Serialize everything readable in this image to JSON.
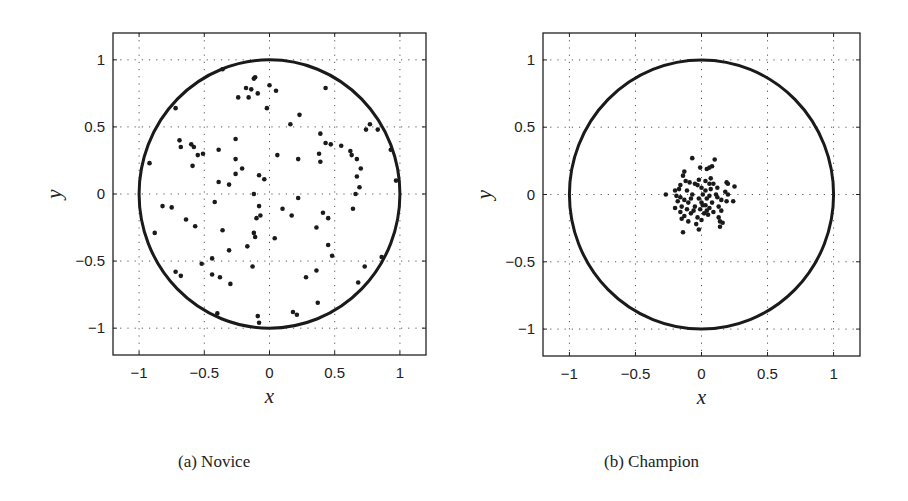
{
  "figure": {
    "captions": [
      "(a) Novice",
      "(b) Champion"
    ]
  },
  "chart_data": [
    {
      "type": "scatter",
      "title": "(a) Novice",
      "xlabel": "x",
      "ylabel": "y",
      "xlim": [
        -1.2,
        1.2
      ],
      "ylim": [
        -1.2,
        1.2
      ],
      "xticks": [
        -1,
        -0.5,
        0,
        0.5,
        1
      ],
      "yticks": [
        -1,
        -0.5,
        0,
        0.5,
        1
      ],
      "xtick_labels": [
        "−1",
        "−0.5",
        "0",
        "0.5",
        "1"
      ],
      "ytick_labels": [
        "−1",
        "−0.5",
        "0",
        "0.5",
        "1"
      ],
      "grid": true,
      "grid_style": "dotted",
      "overlay": {
        "shape": "circle",
        "center": [
          0,
          0
        ],
        "radius": 1
      },
      "points": [
        [
          -0.11,
          0.87
        ],
        [
          -0.12,
          0.86
        ],
        [
          -0.18,
          0.79
        ],
        [
          -0.14,
          0.78
        ],
        [
          -0.16,
          0.72
        ],
        [
          -0.24,
          0.72
        ],
        [
          -0.09,
          0.75
        ],
        [
          0.0,
          0.81
        ],
        [
          0.05,
          0.77
        ],
        [
          -0.02,
          0.64
        ],
        [
          -0.36,
          0.93
        ],
        [
          -0.72,
          0.64
        ],
        [
          0.43,
          0.79
        ],
        [
          0.16,
          0.52
        ],
        [
          0.23,
          0.59
        ],
        [
          0.77,
          0.52
        ],
        [
          0.74,
          0.48
        ],
        [
          0.83,
          0.48
        ],
        [
          0.93,
          0.33
        ],
        [
          -0.69,
          0.4
        ],
        [
          -0.68,
          0.35
        ],
        [
          -0.6,
          0.37
        ],
        [
          -0.58,
          0.35
        ],
        [
          -0.55,
          0.29
        ],
        [
          -0.51,
          0.3
        ],
        [
          -0.59,
          0.21
        ],
        [
          -0.92,
          0.23
        ],
        [
          -0.39,
          0.33
        ],
        [
          -0.26,
          0.41
        ],
        [
          -0.26,
          0.26
        ],
        [
          -0.26,
          0.15
        ],
        [
          -0.21,
          0.19
        ],
        [
          -0.39,
          0.09
        ],
        [
          -0.31,
          0.07
        ],
        [
          -0.08,
          0.14
        ],
        [
          -0.04,
          0.11
        ],
        [
          0.06,
          0.29
        ],
        [
          0.22,
          0.26
        ],
        [
          0.39,
          0.45
        ],
        [
          0.43,
          0.38
        ],
        [
          0.47,
          0.37
        ],
        [
          0.38,
          0.3
        ],
        [
          0.39,
          0.24
        ],
        [
          0.55,
          0.36
        ],
        [
          0.62,
          0.32
        ],
        [
          0.63,
          0.29
        ],
        [
          0.67,
          0.26
        ],
        [
          0.7,
          0.19
        ],
        [
          0.67,
          0.13
        ],
        [
          0.69,
          0.05
        ],
        [
          0.66,
          0.0
        ],
        [
          0.97,
          0.1
        ],
        [
          -0.12,
          0.0
        ],
        [
          0.22,
          -0.03
        ],
        [
          -0.08,
          -0.09
        ],
        [
          0.1,
          -0.11
        ],
        [
          0.17,
          -0.16
        ],
        [
          -0.07,
          -0.16
        ],
        [
          -0.1,
          -0.18
        ],
        [
          -0.82,
          -0.09
        ],
        [
          -0.75,
          -0.1
        ],
        [
          -0.64,
          -0.19
        ],
        [
          -0.57,
          -0.24
        ],
        [
          -0.42,
          -0.06
        ],
        [
          -0.36,
          -0.27
        ],
        [
          -0.12,
          -0.29
        ],
        [
          -0.11,
          -0.32
        ],
        [
          0.04,
          -0.33
        ],
        [
          0.41,
          -0.14
        ],
        [
          0.45,
          -0.18
        ],
        [
          0.64,
          -0.11
        ],
        [
          0.36,
          -0.25
        ],
        [
          -0.88,
          -0.29
        ],
        [
          -0.31,
          -0.42
        ],
        [
          -0.17,
          -0.39
        ],
        [
          0.45,
          -0.38
        ],
        [
          0.48,
          -0.46
        ],
        [
          -0.44,
          -0.48
        ],
        [
          -0.52,
          -0.52
        ],
        [
          -0.13,
          -0.54
        ],
        [
          0.73,
          -0.54
        ],
        [
          0.86,
          -0.47
        ],
        [
          -0.72,
          -0.58
        ],
        [
          -0.68,
          -0.61
        ],
        [
          -0.44,
          -0.6
        ],
        [
          -0.38,
          -0.62
        ],
        [
          -0.3,
          -0.67
        ],
        [
          0.28,
          -0.62
        ],
        [
          0.36,
          -0.57
        ],
        [
          0.68,
          -0.66
        ],
        [
          0.37,
          -0.81
        ],
        [
          0.18,
          -0.88
        ],
        [
          0.21,
          -0.9
        ],
        [
          -0.09,
          -0.91
        ],
        [
          -0.08,
          -0.96
        ],
        [
          -0.4,
          -0.89
        ]
      ]
    },
    {
      "type": "scatter",
      "title": "(b) Champion",
      "xlabel": "x",
      "ylabel": "y",
      "xlim": [
        -1.2,
        1.2
      ],
      "ylim": [
        -1.2,
        1.2
      ],
      "xticks": [
        -1,
        -0.5,
        0,
        0.5,
        1
      ],
      "yticks": [
        -1,
        -0.5,
        0,
        0.5,
        1
      ],
      "xtick_labels": [
        "−1",
        "−0.5",
        "0",
        "0.5",
        "1"
      ],
      "ytick_labels": [
        "−1",
        "−0.5",
        "0",
        "0.5",
        "1"
      ],
      "grid": true,
      "grid_style": "dotted",
      "overlay": {
        "shape": "circle",
        "center": [
          0,
          0
        ],
        "radius": 1
      },
      "points": [
        [
          -0.07,
          0.27
        ],
        [
          0.1,
          0.26
        ],
        [
          -0.01,
          0.2
        ],
        [
          0.06,
          0.2
        ],
        [
          0.08,
          0.21
        ],
        [
          0.04,
          0.19
        ],
        [
          -0.13,
          0.17
        ],
        [
          -0.14,
          0.14
        ],
        [
          -0.02,
          0.11
        ],
        [
          0.03,
          0.1
        ],
        [
          -0.09,
          0.09
        ],
        [
          0.06,
          0.08
        ],
        [
          0.09,
          0.08
        ],
        [
          0.19,
          0.09
        ],
        [
          0.2,
          0.08
        ],
        [
          -0.05,
          0.08
        ],
        [
          -0.16,
          0.07
        ],
        [
          0.25,
          0.06
        ],
        [
          -0.17,
          0.04
        ],
        [
          0.0,
          0.05
        ],
        [
          0.12,
          0.05
        ],
        [
          -0.2,
          0.03
        ],
        [
          -0.11,
          0.03
        ],
        [
          0.03,
          0.03
        ],
        [
          0.07,
          0.04
        ],
        [
          0.18,
          0.02
        ],
        [
          -0.27,
          0.0
        ],
        [
          -0.19,
          -0.01
        ],
        [
          -0.07,
          0.0
        ],
        [
          0.01,
          0.0
        ],
        [
          0.11,
          0.0
        ],
        [
          0.2,
          0.0
        ],
        [
          -0.16,
          -0.02
        ],
        [
          -0.13,
          -0.04
        ],
        [
          -0.02,
          -0.03
        ],
        [
          0.04,
          -0.03
        ],
        [
          0.15,
          -0.04
        ],
        [
          0.24,
          -0.05
        ],
        [
          -0.18,
          -0.05
        ],
        [
          -0.1,
          -0.06
        ],
        [
          0.0,
          -0.06
        ],
        [
          0.08,
          -0.06
        ],
        [
          0.19,
          -0.05
        ],
        [
          -0.15,
          -0.09
        ],
        [
          -0.05,
          -0.09
        ],
        [
          0.03,
          -0.08
        ],
        [
          0.06,
          -0.1
        ],
        [
          0.13,
          -0.09
        ],
        [
          -0.2,
          -0.1
        ],
        [
          -0.11,
          -0.11
        ],
        [
          -0.01,
          -0.11
        ],
        [
          0.04,
          -0.12
        ],
        [
          0.15,
          -0.12
        ],
        [
          -0.16,
          -0.13
        ],
        [
          -0.08,
          -0.14
        ],
        [
          0.02,
          -0.14
        ],
        [
          0.09,
          -0.13
        ],
        [
          -0.13,
          -0.16
        ],
        [
          -0.03,
          -0.17
        ],
        [
          0.13,
          -0.17
        ],
        [
          -0.15,
          -0.18
        ],
        [
          0.05,
          -0.15
        ],
        [
          -0.1,
          -0.2
        ],
        [
          0.14,
          -0.2
        ],
        [
          0.16,
          -0.21
        ],
        [
          -0.04,
          -0.22
        ],
        [
          0.0,
          -0.19
        ],
        [
          0.14,
          -0.24
        ],
        [
          -0.14,
          -0.28
        ],
        [
          -0.02,
          -0.26
        ],
        [
          -0.06,
          -0.12
        ],
        [
          0.07,
          0.12
        ],
        [
          -0.12,
          0.1
        ],
        [
          0.12,
          -0.02
        ],
        [
          -0.03,
          0.07
        ],
        [
          0.01,
          -0.08
        ],
        [
          -0.08,
          -0.03
        ],
        [
          0.06,
          -0.01
        ]
      ]
    }
  ]
}
